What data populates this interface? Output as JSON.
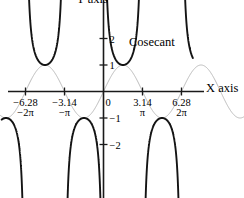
{
  "chart_data": {
    "type": "line",
    "title": "",
    "xlabel": "X axis",
    "ylabel": "Y axis",
    "xlim": [
      -8.2,
      7.2
    ],
    "ylim": [
      -2.75,
      2.4
    ],
    "grid": false,
    "legend_position": "inline-annotation",
    "annotations": [
      {
        "text": "Cosecant",
        "x": 2.05,
        "y": 1.72
      }
    ],
    "xticks": [
      {
        "value": -6.28,
        "label": "−6.28",
        "sublabel": "−2π"
      },
      {
        "value": -3.14,
        "label": "−3.14",
        "sublabel": "−π"
      },
      {
        "value": 0,
        "label": "0",
        "sublabel": ""
      },
      {
        "value": 3.14,
        "label": "3.14",
        "sublabel": "π"
      },
      {
        "value": 6.28,
        "label": "6.28",
        "sublabel": "2π"
      }
    ],
    "yticks": [
      {
        "value": 2,
        "label": "2"
      },
      {
        "value": 1,
        "label": "1"
      },
      {
        "value": -1,
        "label": "−1"
      },
      {
        "value": -2,
        "label": "−2"
      }
    ],
    "series": [
      {
        "name": "Cosecant",
        "function": "csc(x)",
        "color": "#141414",
        "style": "solid",
        "asymptotes": [
          -6.28318,
          -3.14159,
          0,
          3.14159,
          6.28318
        ],
        "branches": [
          {
            "x_start": -8.2,
            "x_end": -6.28318,
            "note": "descending to -infinity at -2pi, minimum magnitude -1 at -5pi/2"
          },
          {
            "x_start": -6.28318,
            "x_end": -3.14159,
            "note": "upper branch, minimum 1 at -3pi/2"
          },
          {
            "x_start": -3.14159,
            "x_end": 0,
            "note": "lower branch, maximum -1 at -pi/2"
          },
          {
            "x_start": 0,
            "x_end": 3.14159,
            "note": "upper branch, minimum 1 at pi/2"
          },
          {
            "x_start": 3.14159,
            "x_end": 6.28318,
            "note": "lower branch, maximum -1 at 3pi/2"
          },
          {
            "x_start": 6.28318,
            "x_end": 7.2,
            "note": "upper branch rising to +infinity at 2pi"
          }
        ]
      },
      {
        "name": "Sine",
        "function": "sin(x)",
        "color": "#bcbcbc",
        "style": "solid",
        "amplitude": 1,
        "period": 6.28318
      }
    ]
  },
  "labels": {
    "x_axis": "X axis",
    "y_axis": "Y axis",
    "cosecant": "Cosecant"
  },
  "colors": {
    "axis": "#1a1a1a",
    "cosecant": "#141414",
    "sine": "#bcbcbc",
    "background": "#ffffff"
  }
}
